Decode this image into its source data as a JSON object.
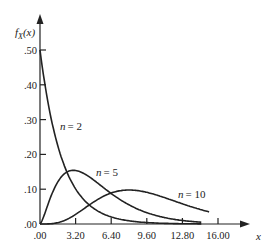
{
  "chart_data": {
    "type": "line",
    "title": "",
    "xlabel": "x",
    "ylabel": "f_X(x)",
    "xlim": [
      0,
      16.0
    ],
    "ylim": [
      0,
      0.5
    ],
    "x_ticks": [
      ".00",
      "3.20",
      "6.40",
      "9.60",
      "12.80",
      "16.00"
    ],
    "y_ticks": [
      ".00",
      ".10",
      ".20",
      ".30",
      ".40",
      ".50"
    ],
    "grid": false,
    "legend": "none (inline annotations)",
    "series": [
      {
        "name": "n = 2",
        "label_n": "n",
        "label_val": "= 2",
        "x": [
          0,
          1,
          2,
          3,
          4,
          5,
          6,
          8,
          10,
          12,
          14
        ],
        "values": [
          0.5,
          0.303,
          0.184,
          0.112,
          0.068,
          0.041,
          0.025,
          0.009,
          0.003,
          0.001,
          0.0005
        ]
      },
      {
        "name": "n = 5",
        "label_n": "n",
        "label_val": "= 5",
        "x": [
          0,
          1,
          2,
          3,
          4,
          5,
          6,
          8,
          10,
          12,
          14
        ],
        "values": [
          0,
          0.081,
          0.138,
          0.154,
          0.144,
          0.122,
          0.096,
          0.053,
          0.027,
          0.013,
          0.006
        ]
      },
      {
        "name": "n = 10",
        "label_n": "n",
        "label_val": "= 10",
        "x": [
          0,
          2,
          4,
          6,
          8,
          10,
          12,
          14,
          15.2
        ],
        "values": [
          0,
          0.008,
          0.045,
          0.084,
          0.098,
          0.088,
          0.066,
          0.043,
          0.033
        ]
      }
    ]
  },
  "axes": {
    "y_label_main": "f",
    "y_label_sub": "X",
    "y_label_arg": "(x)",
    "x_label": "x"
  }
}
